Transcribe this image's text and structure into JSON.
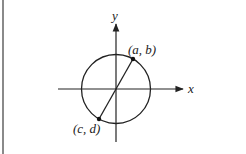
{
  "diagram": {
    "type": "coordinate-plane-circle",
    "axes": {
      "x_label": "x",
      "y_label": "y"
    },
    "circle": {
      "center": "origin"
    },
    "points": [
      {
        "id": "p1",
        "label": "(a, b)",
        "position": "upper-right on circle"
      },
      {
        "id": "p2",
        "label": "(c, d)",
        "position": "lower-left on circle"
      }
    ],
    "segment": {
      "from": "(c, d)",
      "to": "(a, b)",
      "passes_through": "origin"
    },
    "top_cut_text": "· · · · · · · · ·"
  }
}
